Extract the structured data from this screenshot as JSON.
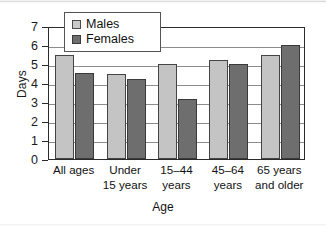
{
  "chart_data": {
    "type": "bar",
    "title": "",
    "xlabel": "Age",
    "ylabel": "Days",
    "ylim": [
      0,
      7
    ],
    "yticks": [
      0,
      1,
      2,
      3,
      4,
      5,
      6,
      7
    ],
    "grid": true,
    "legend_position": "top-left-inside",
    "categories": [
      "All ages",
      "Under 15 years",
      "15–44 years",
      "45–64 years",
      "65 years and older"
    ],
    "category_lines": [
      [
        "All ages",
        ""
      ],
      [
        "Under",
        "15 years"
      ],
      [
        "15–44",
        "years"
      ],
      [
        "45–64",
        "years"
      ],
      [
        "65 years",
        "and older"
      ]
    ],
    "series": [
      {
        "name": "Males",
        "color": "#c4c4c4",
        "values": [
          5.45,
          4.5,
          5.0,
          5.2,
          5.5
        ]
      },
      {
        "name": "Females",
        "color": "#6e6e6e",
        "values": [
          4.55,
          4.2,
          3.15,
          5.0,
          6.0
        ]
      }
    ]
  },
  "legend": {
    "items": [
      {
        "label": "Males",
        "swatch": "light-gray-square"
      },
      {
        "label": "Females",
        "swatch": "dark-gray-square"
      }
    ]
  },
  "axes": {
    "y_title": "Days",
    "x_title": "Age",
    "y_tick_labels": [
      "0",
      "1",
      "2",
      "3",
      "4",
      "5",
      "6",
      "7"
    ]
  },
  "colors": {
    "males": "#c4c4c4",
    "females": "#6e6e6e",
    "axis": "#2b2b2b",
    "grid": "#8c8c8c",
    "background": "#ffffff"
  }
}
